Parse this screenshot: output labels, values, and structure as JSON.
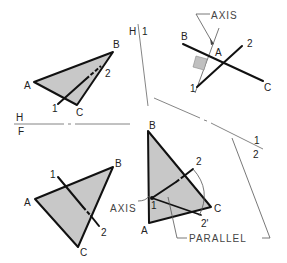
{
  "figure": {
    "reference_lines": {
      "hf": {
        "top": "H",
        "bottom": "F"
      },
      "h1": {
        "left": "H",
        "right": "1"
      },
      "12": {
        "top": "1",
        "bottom": "2"
      }
    },
    "top_view": {
      "vertices": {
        "a": "A",
        "b": "B",
        "c": "C"
      },
      "line_points": {
        "p1": "1",
        "p2": "2"
      }
    },
    "aux1_view": {
      "axis_label": "AXIS",
      "vertices": {
        "a": "A",
        "b": "B",
        "c": "C"
      },
      "line_points": {
        "p1": "1",
        "p2": "2"
      }
    },
    "front_view": {
      "vertices": {
        "a": "A",
        "b": "B",
        "c": "C"
      },
      "line_points": {
        "p1": "1",
        "p2": "2"
      }
    },
    "aux2_view": {
      "axis_label": "AXIS",
      "parallel_label": "PARALLEL",
      "vertices": {
        "a": "A",
        "b": "B",
        "c": "C"
      },
      "line_points": {
        "p1": "1",
        "p2": "2",
        "p2prime": "2'"
      }
    }
  },
  "colors": {
    "plane_fill": "#c8c8c8",
    "line": "#111111",
    "reference": "#666666"
  }
}
